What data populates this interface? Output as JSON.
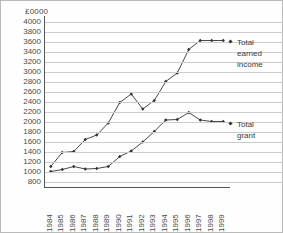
{
  "chart_data": {
    "type": "line",
    "title": "",
    "xlabel": "",
    "ylabel": "£0000",
    "unit_label": "£0000",
    "grid": true,
    "legend_position": "right",
    "categories": [
      "1984",
      "1985",
      "1986",
      "1987",
      "1988",
      "1989",
      "1990",
      "1991",
      "1992",
      "1993",
      "1994",
      "1995",
      "1996",
      "1997",
      "1998",
      "1999"
    ],
    "ylim": [
      800,
      4000
    ],
    "ytick_step": 200,
    "ytick_labels": [
      "4000",
      "3800",
      "3600",
      "3400",
      "3200",
      "3000",
      "2800",
      "2600",
      "2400",
      "2200",
      "2000",
      "1800",
      "1600",
      "1400",
      "1200",
      "1000",
      "800"
    ],
    "series": [
      {
        "name": "Total earned income",
        "label_lines": [
          "Total",
          "earned",
          "income"
        ],
        "color": "#333333",
        "marker": "diamond",
        "values": [
          1110,
          1390,
          1410,
          1650,
          1740,
          1980,
          2390,
          2560,
          2260,
          2430,
          2810,
          2980,
          3450,
          3630,
          3630,
          3630
        ]
      },
      {
        "name": "Total grant",
        "label_lines": [
          "Total",
          "grant"
        ],
        "color": "#333333",
        "marker": "diamond",
        "values": [
          1010,
          1050,
          1110,
          1060,
          1070,
          1110,
          1310,
          1420,
          1600,
          1810,
          2040,
          2050,
          2190,
          2040,
          2010,
          2010
        ]
      }
    ]
  },
  "legend": {
    "earned": {
      "lines": [
        "Total",
        "earned",
        "income"
      ]
    },
    "grant": {
      "lines": [
        "Total",
        "grant"
      ]
    }
  }
}
